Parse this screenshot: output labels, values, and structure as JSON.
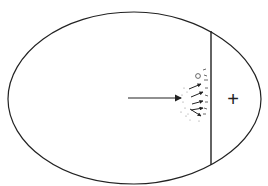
{
  "diagram": {
    "labels": {
      "plus_sign": "+"
    },
    "colors": {
      "line": "#222222",
      "background": "#ffffff",
      "particles": "#888888"
    },
    "elements": [
      "outline",
      "partition",
      "main-arrow",
      "small-arrows",
      "particles",
      "plus-sign"
    ]
  }
}
